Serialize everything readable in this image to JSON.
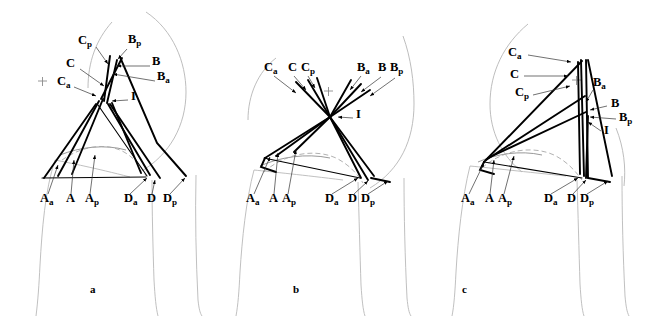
{
  "figure": {
    "type": "anatomical-line-diagram",
    "panel_count": 3,
    "background_color": "#ffffff",
    "line_color": "#000000",
    "outline_color": "#b9b9b9",
    "width": 654,
    "height": 318
  },
  "panels": [
    {
      "id": "a",
      "letter": "a",
      "labels": [
        {
          "key": "Cp",
          "base": "C",
          "sub": "p",
          "x": 78,
          "y": 44
        },
        {
          "key": "Bp",
          "base": "B",
          "sub": "p",
          "x": 128,
          "y": 43
        },
        {
          "key": "C",
          "base": "C",
          "sub": "",
          "x": 66,
          "y": 67
        },
        {
          "key": "B",
          "base": "B",
          "sub": "",
          "x": 152,
          "y": 65
        },
        {
          "key": "Ca",
          "base": "C",
          "sub": "a",
          "x": 57,
          "y": 85
        },
        {
          "key": "Ba",
          "base": "B",
          "sub": "a",
          "x": 157,
          "y": 80
        },
        {
          "key": "I",
          "base": "I",
          "sub": "",
          "x": 131,
          "y": 100
        },
        {
          "key": "Aa",
          "base": "A",
          "sub": "a",
          "x": 40,
          "y": 202
        },
        {
          "key": "A",
          "base": "A",
          "sub": "",
          "x": 66,
          "y": 202
        },
        {
          "key": "Ap",
          "base": "A",
          "sub": "p",
          "x": 85,
          "y": 202
        },
        {
          "key": "Da",
          "base": "D",
          "sub": "a",
          "x": 124,
          "y": 202
        },
        {
          "key": "D",
          "base": "D",
          "sub": "",
          "x": 147,
          "y": 202
        },
        {
          "key": "Dp",
          "base": "D",
          "sub": "p",
          "x": 163,
          "y": 202
        }
      ]
    },
    {
      "id": "b",
      "letter": "b",
      "labels": [
        {
          "key": "Ca",
          "base": "C",
          "sub": "a",
          "x": 46,
          "y": 71
        },
        {
          "key": "C",
          "base": "C",
          "sub": "",
          "x": 70,
          "y": 71
        },
        {
          "key": "Cp",
          "base": "C",
          "sub": "p",
          "x": 83,
          "y": 71
        },
        {
          "key": "Ba",
          "base": "B",
          "sub": "a",
          "x": 139,
          "y": 71
        },
        {
          "key": "B",
          "base": "B",
          "sub": "",
          "x": 160,
          "y": 71
        },
        {
          "key": "Bp",
          "base": "B",
          "sub": "p",
          "x": 172,
          "y": 71
        },
        {
          "key": "I",
          "base": "I",
          "sub": "",
          "x": 138,
          "y": 118
        },
        {
          "key": "Aa",
          "base": "A",
          "sub": "a",
          "x": 28,
          "y": 202
        },
        {
          "key": "A",
          "base": "A",
          "sub": "",
          "x": 51,
          "y": 202
        },
        {
          "key": "Ap",
          "base": "A",
          "sub": "p",
          "x": 64,
          "y": 202
        },
        {
          "key": "Da",
          "base": "D",
          "sub": "a",
          "x": 107,
          "y": 202
        },
        {
          "key": "D",
          "base": "D",
          "sub": "",
          "x": 130,
          "y": 202
        },
        {
          "key": "Dp",
          "base": "D",
          "sub": "p",
          "x": 143,
          "y": 202
        }
      ]
    },
    {
      "id": "c",
      "letter": "c",
      "labels": [
        {
          "key": "Ca",
          "base": "C",
          "sub": "a",
          "x": 72,
          "y": 56
        },
        {
          "key": "C",
          "base": "C",
          "sub": "",
          "x": 74,
          "y": 78
        },
        {
          "key": "Cp",
          "base": "C",
          "sub": "p",
          "x": 79,
          "y": 96
        },
        {
          "key": "Ba",
          "base": "B",
          "sub": "a",
          "x": 157,
          "y": 86
        },
        {
          "key": "B",
          "base": "B",
          "sub": "",
          "x": 175,
          "y": 107
        },
        {
          "key": "Bp",
          "base": "B",
          "sub": "p",
          "x": 183,
          "y": 121
        },
        {
          "key": "I",
          "base": "I",
          "sub": "",
          "x": 168,
          "y": 134
        },
        {
          "key": "Aa",
          "base": "A",
          "sub": "a",
          "x": 25,
          "y": 202
        },
        {
          "key": "A",
          "base": "A",
          "sub": "",
          "x": 49,
          "y": 202
        },
        {
          "key": "Ap",
          "base": "A",
          "sub": "p",
          "x": 62,
          "y": 202
        },
        {
          "key": "Da",
          "base": "D",
          "sub": "a",
          "x": 108,
          "y": 202
        },
        {
          "key": "D",
          "base": "D",
          "sub": "",
          "x": 131,
          "y": 202
        },
        {
          "key": "Dp",
          "base": "D",
          "sub": "p",
          "x": 144,
          "y": 202
        }
      ]
    }
  ]
}
